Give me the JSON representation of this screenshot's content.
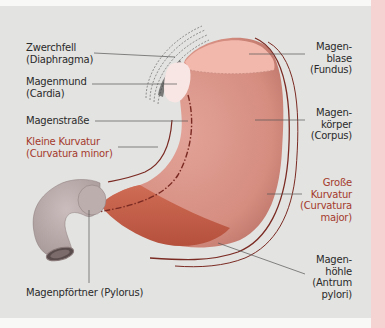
{
  "colors": {
    "background": "#e3e3e1",
    "accent_strip": "#f6d3d3",
    "stomach_body": "#d9968a",
    "fundus": "#f2b8ac",
    "cardia": "#f8e6e4",
    "antrum": "#c9614b",
    "duodenum": "#c2b3b3",
    "curvature_line": "#7a2a22",
    "red_label": "#a33a2c",
    "label_text": "#2a2a2a"
  },
  "labels": {
    "diaphragm": {
      "line1": "Zwerchfell",
      "line2": "(Diaphragma)"
    },
    "cardia": {
      "line1": "Magenmund",
      "line2": "(Cardia)"
    },
    "gastric_canal": {
      "line1": "Magenstraße"
    },
    "lesser_curvature": {
      "line1": "Kleine Kurvatur",
      "line2": "(Curvatura minor)"
    },
    "pylorus": {
      "line1": "Magenpförtner (Pylorus)"
    },
    "fundus": {
      "line1": "Magen-",
      "line2": "blase",
      "line3": "(Fundus)"
    },
    "corpus": {
      "line1": "Magen-",
      "line2": "körper",
      "line3": "(Corpus)"
    },
    "greater_curvature": {
      "line1": "Große",
      "line2": "Kurvatur",
      "line3": "(Curvatura",
      "line4": "major)"
    },
    "antrum": {
      "line1": "Magen-",
      "line2": "höhle",
      "line3": "(Antrum",
      "line4": "pylori)"
    }
  }
}
